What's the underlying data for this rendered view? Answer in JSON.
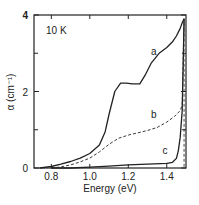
{
  "chart_data": {
    "type": "line",
    "title": "",
    "annotation": "10 K",
    "xlabel": "Energy (eV)",
    "ylabel": "α (cm⁻¹)",
    "xlim": [
      0.71,
      1.5
    ],
    "ylim": [
      0,
      4
    ],
    "xticks": [
      0.8,
      1.0,
      1.2,
      1.4
    ],
    "xtick_labels": [
      "0.8",
      "1.0",
      "1.2",
      "1.4"
    ],
    "yticks": [
      0,
      2,
      4
    ],
    "ytick_labels": [
      "0",
      "2",
      "4"
    ],
    "grid": false,
    "series": [
      {
        "name": "a",
        "style": "solid",
        "x": [
          0.74,
          0.8,
          0.85,
          0.9,
          0.95,
          1.0,
          1.05,
          1.08,
          1.1,
          1.13,
          1.16,
          1.19,
          1.22,
          1.26,
          1.29,
          1.32,
          1.36,
          1.4,
          1.43,
          1.45,
          1.47,
          1.48,
          1.49
        ],
        "y": [
          0.0,
          0.04,
          0.1,
          0.17,
          0.26,
          0.38,
          0.6,
          0.95,
          1.4,
          2.0,
          2.22,
          2.22,
          2.2,
          2.2,
          2.45,
          2.75,
          3.0,
          3.15,
          3.3,
          3.45,
          3.65,
          3.8,
          3.9
        ]
      },
      {
        "name": "b",
        "style": "dashed",
        "x": [
          0.8,
          0.85,
          0.9,
          0.95,
          1.0,
          1.05,
          1.1,
          1.15,
          1.2,
          1.25,
          1.3,
          1.35,
          1.4,
          1.44,
          1.47,
          1.48,
          1.49
        ],
        "y": [
          0.0,
          0.03,
          0.08,
          0.16,
          0.26,
          0.42,
          0.62,
          0.78,
          0.86,
          0.92,
          0.98,
          1.06,
          1.2,
          1.35,
          1.5,
          1.65,
          3.9
        ]
      },
      {
        "name": "c",
        "style": "solid",
        "x": [
          0.8,
          0.9,
          1.0,
          1.1,
          1.2,
          1.3,
          1.4,
          1.43,
          1.45,
          1.46,
          1.47,
          1.48,
          1.49
        ],
        "y": [
          0.0,
          0.0,
          0.02,
          0.05,
          0.08,
          0.1,
          0.12,
          0.15,
          0.25,
          0.45,
          0.8,
          1.5,
          3.9
        ]
      }
    ]
  }
}
